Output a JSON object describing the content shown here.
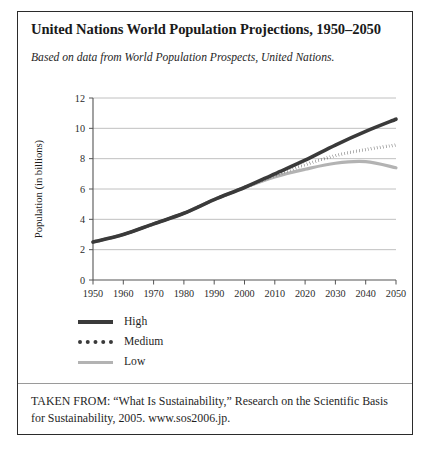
{
  "figure": {
    "title": "United Nations World Population Projections, 1950–2050",
    "subtitle": "Based on data from World Population Prospects, United Nations.",
    "source_note": "TAKEN FROM: “What Is Sustainability,” Research on the Scientific Basis for Sustainability, 2005. www.sos2006.jp."
  },
  "colors": {
    "high_line": "#3a3a3a",
    "medium_line": "#3a3a3a",
    "low_line": "#b3b3b3",
    "gridline": "#b9b9b9",
    "axis": "#555555",
    "frame": "#2b2b2b",
    "text": "#1a1a1a"
  },
  "legend": {
    "position": "below-plot-left",
    "entries": [
      {
        "label": "High",
        "style": "solid-thick-dark",
        "swatch_class": "sw-high"
      },
      {
        "label": "Medium",
        "style": "dotted-dark",
        "swatch_class": "sw-medium"
      },
      {
        "label": "Low",
        "style": "solid-light-gray",
        "swatch_class": "sw-low"
      }
    ]
  },
  "chart_data": {
    "type": "line",
    "title": "United Nations World Population Projections, 1950–2050",
    "subtitle": "Based on data from World Population Prospects, United Nations.",
    "xlabel": "",
    "ylabel": "Population (in billions)",
    "x": [
      1950,
      1960,
      1970,
      1980,
      1990,
      2000,
      2010,
      2020,
      2030,
      2040,
      2050
    ],
    "xlim": [
      1950,
      2050
    ],
    "ylim": [
      0,
      12
    ],
    "xticks": [
      1950,
      1960,
      1970,
      1980,
      1990,
      2000,
      2010,
      2020,
      2030,
      2040,
      2050
    ],
    "yticks": [
      0,
      2,
      4,
      6,
      8,
      10,
      12
    ],
    "grid": "horizontal",
    "legend_position": "below-plot-left",
    "series": [
      {
        "name": "High",
        "color": "#3a3a3a",
        "style": "solid",
        "values": [
          2.5,
          3.0,
          3.7,
          4.4,
          5.3,
          6.1,
          7.0,
          7.9,
          8.9,
          9.8,
          10.6
        ]
      },
      {
        "name": "Medium",
        "color": "#3a3a3a",
        "style": "dotted",
        "values": [
          2.5,
          3.0,
          3.7,
          4.4,
          5.3,
          6.1,
          6.9,
          7.6,
          8.2,
          8.6,
          8.9
        ]
      },
      {
        "name": "Low",
        "color": "#b3b3b3",
        "style": "solid",
        "values": [
          2.5,
          3.0,
          3.7,
          4.4,
          5.3,
          6.1,
          6.8,
          7.3,
          7.7,
          7.8,
          7.4
        ]
      }
    ]
  }
}
